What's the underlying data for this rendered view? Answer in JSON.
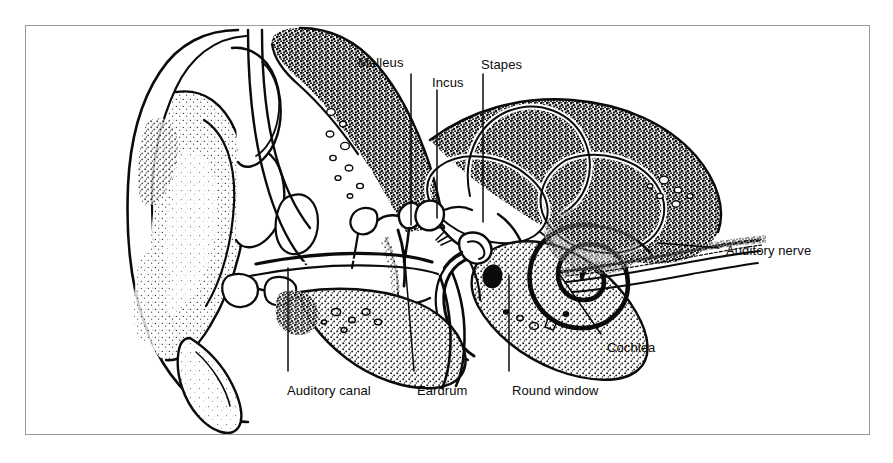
{
  "figure": {
    "kind": "anatomical-illustration",
    "style": "black-and-white stippled line drawing",
    "frame_color": "#9a9a9a",
    "ink_color": "#0b0b0b",
    "background_color": "#ffffff"
  },
  "labels": [
    {
      "id": "malleus",
      "text": "Malleus",
      "x": 358,
      "y": 56,
      "anchor": "start"
    },
    {
      "id": "incus",
      "text": "Incus",
      "x": 432,
      "y": 76,
      "anchor": "start"
    },
    {
      "id": "stapes",
      "text": "Stapes",
      "x": 481,
      "y": 58,
      "anchor": "start"
    },
    {
      "id": "auditory_nerve",
      "text": "Auditory nerve",
      "x": 726,
      "y": 244,
      "anchor": "start"
    },
    {
      "id": "cochlea",
      "text": "Cochlea",
      "x": 607,
      "y": 341,
      "anchor": "start"
    },
    {
      "id": "auditory_canal",
      "text": "Auditory canal",
      "x": 287,
      "y": 384,
      "anchor": "start"
    },
    {
      "id": "eardrum",
      "text": "Eardrum",
      "x": 417,
      "y": 384,
      "anchor": "start"
    },
    {
      "id": "round_window",
      "text": "Round window",
      "x": 512,
      "y": 384,
      "anchor": "start"
    }
  ],
  "leader_lines": [
    {
      "id": "leader-malleus",
      "points": "411,74 411,225"
    },
    {
      "id": "leader-incus",
      "points": "437,90 437,218"
    },
    {
      "id": "leader-stapes",
      "points": "483,74 483,222"
    },
    {
      "id": "leader-auditory-nerve",
      "points": "719,248 659,243"
    },
    {
      "id": "leader-cochlea",
      "points": "601,334 560,275"
    },
    {
      "id": "leader-auditory-canal",
      "points": "288,371 288,268"
    },
    {
      "id": "leader-eardrum",
      "points": "414,371 404,250"
    },
    {
      "id": "leader-round-window",
      "points": "509,371 509,275"
    }
  ],
  "structures": [
    {
      "id": "pinna",
      "name": "Pinna (outer ear)"
    },
    {
      "id": "auditory-canal",
      "name": "Auditory canal"
    },
    {
      "id": "eardrum",
      "name": "Eardrum (tympanic membrane)"
    },
    {
      "id": "malleus",
      "name": "Malleus (hammer)"
    },
    {
      "id": "incus",
      "name": "Incus (anvil)"
    },
    {
      "id": "stapes",
      "name": "Stapes (stirrup)"
    },
    {
      "id": "semicircular-canals",
      "name": "Semicircular canals"
    },
    {
      "id": "cochlea",
      "name": "Cochlea"
    },
    {
      "id": "round-window",
      "name": "Round window"
    },
    {
      "id": "auditory-nerve",
      "name": "Auditory nerve"
    },
    {
      "id": "eustachian-tube",
      "name": "Eustachian tube"
    },
    {
      "id": "temporal-bone",
      "name": "Temporal bone (stippled)"
    }
  ]
}
